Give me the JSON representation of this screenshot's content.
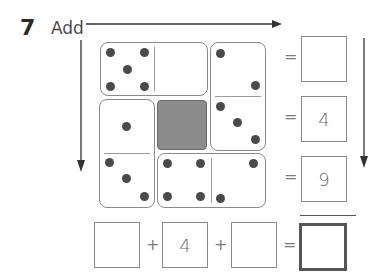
{
  "question": {
    "number": "7",
    "instruction": "Add"
  },
  "arrows": {
    "horizontal": "right-arrow",
    "left_vertical": "down-arrow",
    "right_vertical": "down-arrow"
  },
  "grid": {
    "dominoes": [
      {
        "id": "top-horizontal",
        "orientation": "horizontal",
        "halves": [
          5,
          0
        ]
      },
      {
        "id": "top-right-vertical",
        "orientation": "vertical",
        "halves": [
          2,
          3
        ]
      },
      {
        "id": "mid-left-vertical",
        "orientation": "vertical",
        "halves": [
          1,
          3
        ]
      },
      {
        "id": "bottom-horizontal",
        "orientation": "horizontal",
        "halves": [
          4,
          2
        ]
      }
    ],
    "shaded_square": "hidden-cell",
    "shaded_color": "#8c8c8c"
  },
  "row_sums": {
    "equals_symbol": "=",
    "values": [
      "",
      "4",
      "9"
    ]
  },
  "column_sums": {
    "plus_symbol": "+",
    "equals_symbol": "=",
    "values": [
      "",
      "4",
      ""
    ],
    "total": ""
  }
}
